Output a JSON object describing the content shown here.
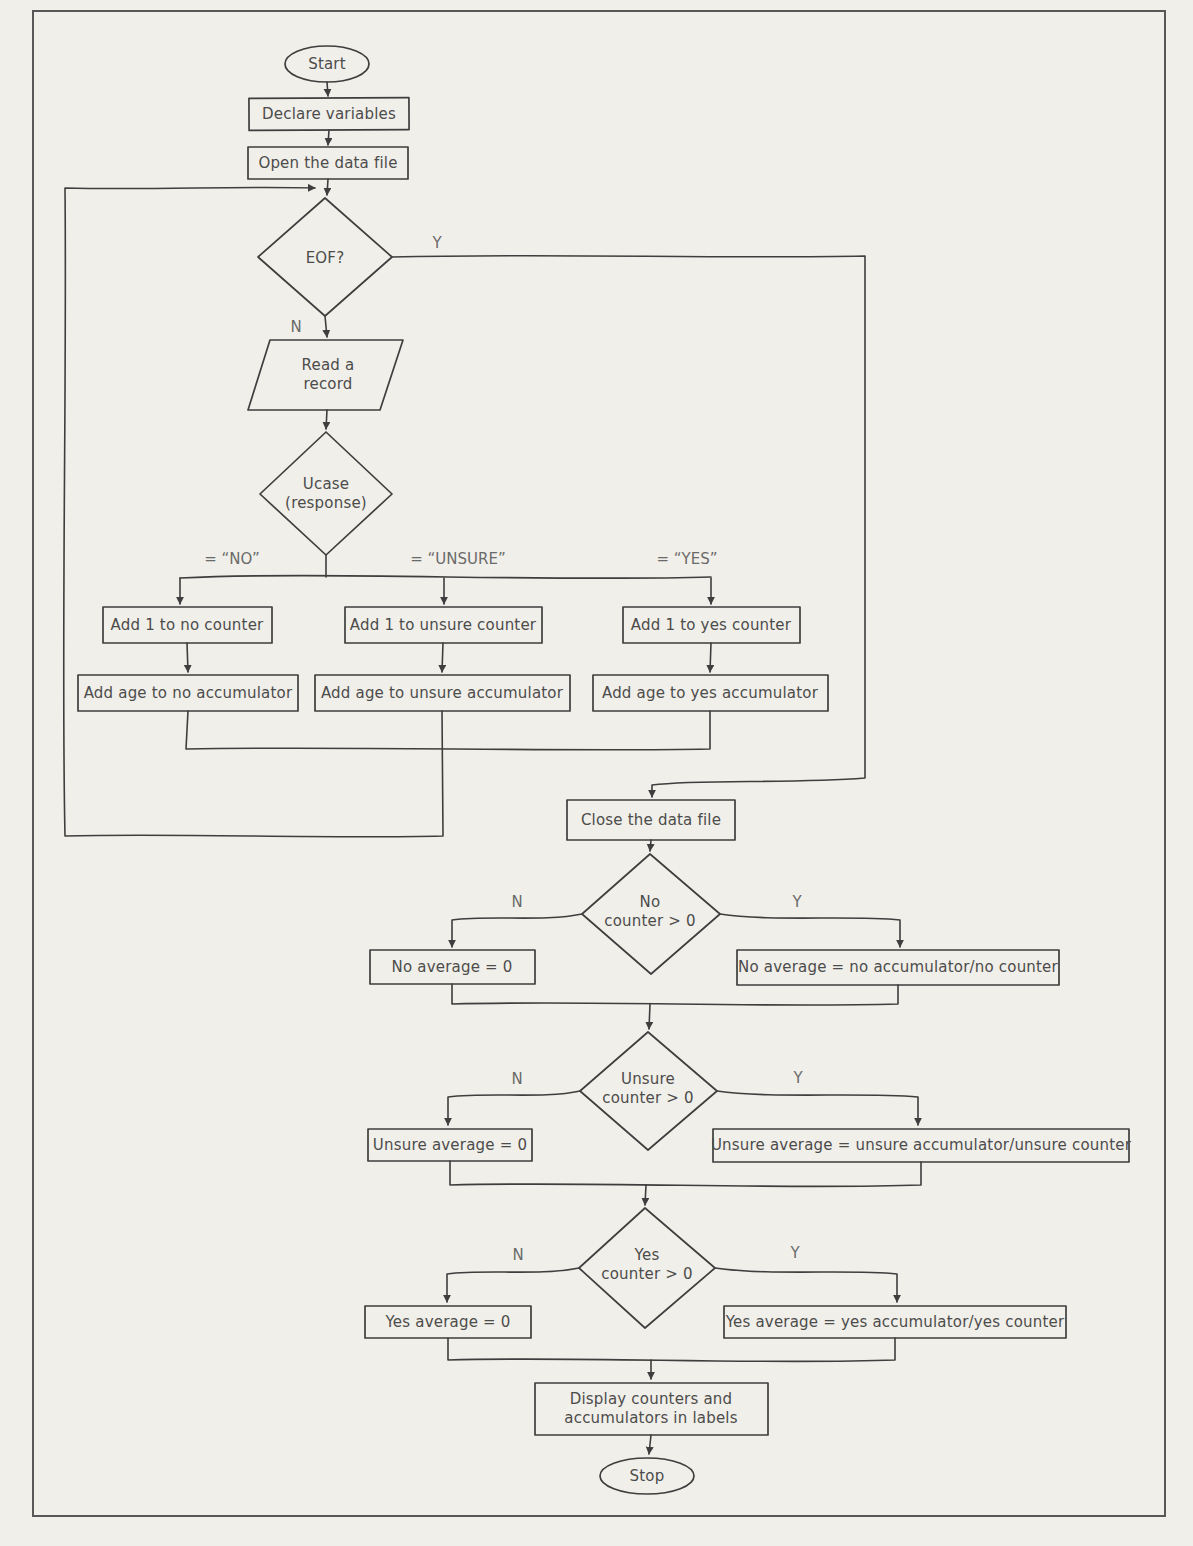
{
  "page": {
    "background": "#f1efe9",
    "ink": "#3e3e3e",
    "text_color": "#4c4c4c"
  },
  "nodes": {
    "start": {
      "label": "Start"
    },
    "declare": {
      "label": "Declare variables"
    },
    "open_file": {
      "label": "Open the data file"
    },
    "eof_decision": {
      "label": "EOF?"
    },
    "read_record": {
      "line1": "Read a",
      "line2": "record"
    },
    "ucase_decision": {
      "line1": "Ucase",
      "line2": "(response)"
    },
    "add1_no": {
      "label": "Add 1 to no counter"
    },
    "add1_unsure": {
      "label": "Add 1 to unsure counter"
    },
    "add1_yes": {
      "label": "Add 1 to yes counter"
    },
    "addage_no": {
      "label": "Add age to no accumulator"
    },
    "addage_unsure": {
      "label": "Add age to unsure accumulator"
    },
    "addage_yes": {
      "label": "Add age to yes accumulator"
    },
    "close_file": {
      "label": "Close the data file"
    },
    "no_decision": {
      "line1": "No",
      "line2": "counter > 0"
    },
    "no_avg_zero": {
      "label": "No average = 0"
    },
    "no_avg_calc": {
      "label": "No average = no accumulator/no counter"
    },
    "unsure_decision": {
      "line1": "Unsure",
      "line2": "counter > 0"
    },
    "unsure_avg_zero": {
      "label": "Unsure average = 0"
    },
    "unsure_avg_calc": {
      "label": "Unsure average = unsure accumulator/unsure counter"
    },
    "yes_decision": {
      "line1": "Yes",
      "line2": "counter > 0"
    },
    "yes_avg_zero": {
      "label": "Yes average = 0"
    },
    "yes_avg_calc": {
      "label": "Yes average = yes accumulator/yes counter"
    },
    "display_results": {
      "line1": "Display counters and",
      "line2": "accumulators in labels"
    },
    "stop": {
      "label": "Stop"
    }
  },
  "edge_labels": {
    "eof_yes": "Y",
    "eof_no": "N",
    "branch_no": "= “NO”",
    "branch_unsure": "= “UNSURE”",
    "branch_yes": "= “YES”",
    "no_n": "N",
    "no_y": "Y",
    "unsure_n": "N",
    "unsure_y": "Y",
    "yes_n": "N",
    "yes_y": "Y"
  }
}
